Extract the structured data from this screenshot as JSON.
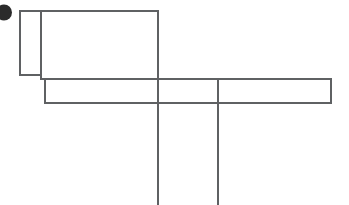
{
  "page": {
    "title": "Wireframe Line Drawing",
    "width": 349,
    "height": 205,
    "background_color": "#ffffff",
    "stroke_color": "#5f6163",
    "blob_color": "#2b2b2b",
    "stroke_width": 1.1
  },
  "shapes": {
    "blob": {
      "name": "dark-blob",
      "cx": 4,
      "cy": 12.5,
      "rx": 8,
      "ry": 8
    },
    "small_rect": {
      "name": "small-left-rectangle",
      "x": 20,
      "y": 11,
      "width": 21,
      "height": 64
    },
    "upper_rect": {
      "name": "upper-wide-rectangle",
      "x": 41,
      "y": 11,
      "width": 117,
      "height": 68
    },
    "lower_rect": {
      "name": "lower-wide-rectangle",
      "x": 45,
      "y": 79,
      "width": 286,
      "height": 24
    },
    "vertical_line_left": {
      "name": "long-vertical-line-left",
      "x1": 158,
      "y1": 11,
      "x2": 158,
      "y2": 205
    },
    "vertical_line_right": {
      "name": "long-vertical-line-right",
      "x1": 218,
      "y1": 79,
      "x2": 218,
      "y2": 205
    }
  },
  "labels": {
    "none": ""
  }
}
